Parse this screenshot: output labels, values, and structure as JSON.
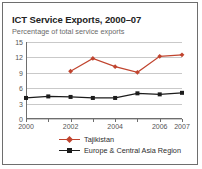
{
  "chart_data": {
    "type": "line",
    "title": "ICT Service Exports, 2000–07",
    "subtitle": "Percentage of total service exports",
    "xlabel": "",
    "ylabel": "",
    "ylim": [
      0,
      15
    ],
    "xlim": [
      2000,
      2007
    ],
    "yticks": [
      0,
      3,
      6,
      9,
      12,
      15
    ],
    "ytick_labels": [
      "0",
      "3",
      "6",
      "9",
      "12",
      "15"
    ],
    "x": [
      2000,
      2001,
      2002,
      2003,
      2004,
      2005,
      2006,
      2007
    ],
    "xtick_labels": [
      "2000",
      "",
      "2002",
      "",
      "2004",
      "",
      "2006",
      "2007"
    ],
    "grid": "horizontal",
    "legend_position": "bottom",
    "series": [
      {
        "name": "Tajikistan",
        "color": "#c0442e",
        "marker": "diamond",
        "x": [
          2002,
          2003,
          2004,
          2005,
          2006,
          2007
        ],
        "values": [
          9.3,
          11.8,
          10.2,
          9.1,
          12.2,
          12.5
        ]
      },
      {
        "name": "Europe & Central Asia Region",
        "color": "#1c1c1c",
        "marker": "square",
        "x": [
          2000,
          2001,
          2002,
          2003,
          2004,
          2005,
          2006,
          2007
        ],
        "values": [
          4.1,
          4.4,
          4.3,
          4.1,
          4.1,
          5.0,
          4.8,
          5.1
        ]
      }
    ]
  },
  "style": {
    "background": "#ffffff",
    "border_color": "#6e6e6e",
    "gridline_color": "#c9c9c9",
    "title_color": "#232323",
    "subtitle_color": "#6b6b6b",
    "tick_color": "#545454"
  }
}
